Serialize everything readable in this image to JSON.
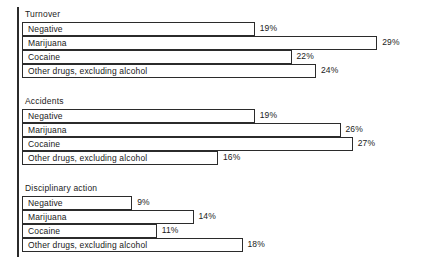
{
  "chart_data": {
    "type": "bar",
    "orientation": "horizontal",
    "title": "",
    "xlabel": "",
    "ylabel": "",
    "xlim": [
      0,
      30
    ],
    "grid": false,
    "legend": "none",
    "value_suffix": "%",
    "categories": [
      "Negative",
      "Marijuana",
      "Cocaine",
      "Other drugs, excluding alcohol"
    ],
    "groups": [
      {
        "name": "Turnover",
        "bars": [
          {
            "label": "Negative",
            "value": 19,
            "value_text": "19%"
          },
          {
            "label": "Marijuana",
            "value": 29,
            "value_text": "29%"
          },
          {
            "label": "Cocaine",
            "value": 22,
            "value_text": "22%"
          },
          {
            "label": "Other drugs, excluding alcohol",
            "value": 24,
            "value_text": "24%"
          }
        ]
      },
      {
        "name": "Accidents",
        "bars": [
          {
            "label": "Negative",
            "value": 19,
            "value_text": "19%"
          },
          {
            "label": "Marijuana",
            "value": 26,
            "value_text": "26%"
          },
          {
            "label": "Cocaine",
            "value": 27,
            "value_text": "27%"
          },
          {
            "label": "Other drugs, excluding alcohol",
            "value": 16,
            "value_text": "16%"
          }
        ]
      },
      {
        "name": "Disciplinary action",
        "bars": [
          {
            "label": "Negative",
            "value": 9,
            "value_text": "9%"
          },
          {
            "label": "Marijuana",
            "value": 14,
            "value_text": "14%"
          },
          {
            "label": "Cocaine",
            "value": 11,
            "value_text": "11%"
          },
          {
            "label": "Other drugs, excluding alcohol",
            "value": 18,
            "value_text": "18%"
          }
        ]
      }
    ],
    "colors": {
      "bar_fill": "#ffffff",
      "bar_stroke": "#2b2b2b",
      "axis": "#2b2b2b",
      "text": "#1a1a1a",
      "background": "#ffffff"
    }
  },
  "layout": {
    "origin_x": 22,
    "px_per_percent": 12.25,
    "row_height": 14,
    "section_tops": [
      8,
      95,
      182
    ],
    "title_offset": 0,
    "first_bar_offset": 14
  }
}
